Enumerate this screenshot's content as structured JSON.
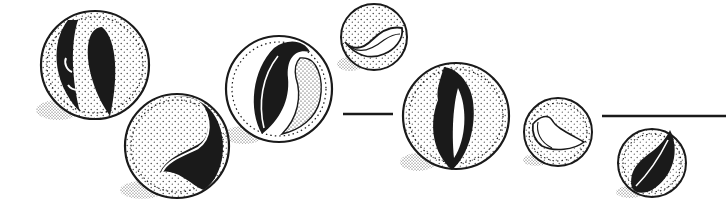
{
  "illustration": {
    "title": "Marbles",
    "colors": {
      "ink": "#1a1a1a",
      "paper": "#ffffff"
    },
    "marbles": [
      {
        "id": "marble-1",
        "cx": 95,
        "cy": 65,
        "r": 54,
        "swirl": "twin-blades"
      },
      {
        "id": "marble-2",
        "cx": 177,
        "cy": 146,
        "r": 52,
        "swirl": "s-curve"
      },
      {
        "id": "marble-3",
        "cx": 279,
        "cy": 89,
        "r": 53,
        "swirl": "flame"
      },
      {
        "id": "marble-4",
        "cx": 374,
        "cy": 37,
        "r": 33,
        "swirl": "wave-band"
      },
      {
        "id": "marble-5",
        "cx": 456,
        "cy": 116,
        "r": 53,
        "swirl": "flame-vertical"
      },
      {
        "id": "marble-6",
        "cx": 558,
        "cy": 132,
        "r": 34,
        "swirl": "bird-outline"
      },
      {
        "id": "marble-7",
        "cx": 652,
        "cy": 163,
        "r": 34,
        "swirl": "leaf"
      }
    ],
    "lines": [
      {
        "id": "divider-1",
        "x1": 343,
        "x2": 393,
        "y": 114
      },
      {
        "id": "divider-2",
        "x1": 602,
        "x2": 726,
        "y": 116
      }
    ]
  }
}
